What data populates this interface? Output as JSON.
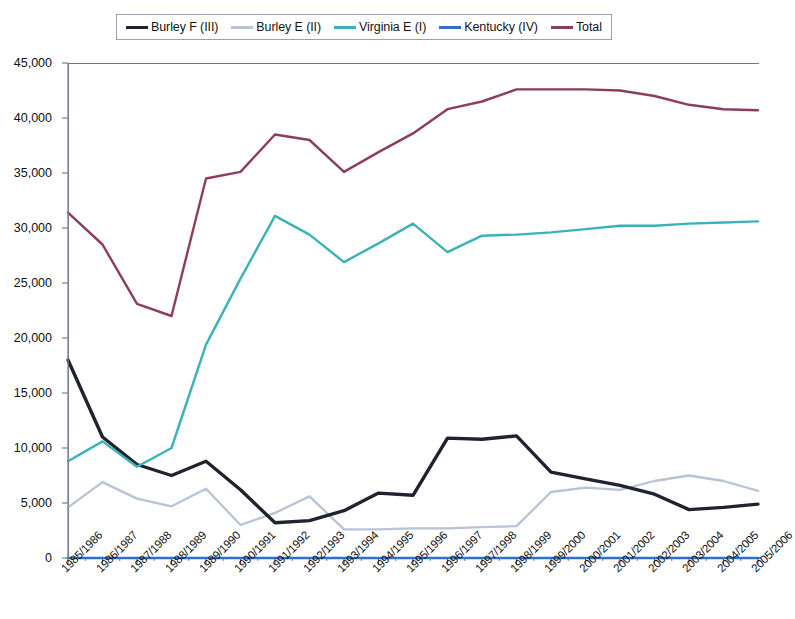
{
  "chart_data": {
    "type": "line",
    "title": "",
    "subtitle": "",
    "xlabel": "",
    "ylabel": "",
    "ylim": [
      0,
      45000
    ],
    "ytick_step": 5000,
    "yticks": [
      "0",
      "5,000",
      "10,000",
      "15,000",
      "20,000",
      "25,000",
      "30,000",
      "35,000",
      "40,000",
      "45,000"
    ],
    "grid": false,
    "legend_position": "top-center",
    "categories": [
      "1985/1986",
      "1986/1987",
      "1987/1988",
      "1988/1989",
      "1989/1990",
      "1990/1991",
      "1991/1992",
      "1992/1993",
      "1993/1994",
      "1994/1995",
      "1995/1996",
      "1996/1997",
      "1997/1998",
      "1998/1999",
      "1999/2000",
      "2000/2001",
      "2001/2002",
      "2002/2003",
      "2003/2004",
      "2004/2005",
      "2005/2006"
    ],
    "series": [
      {
        "name": "Burley F (III)",
        "color": "#1f2330",
        "values": [
          18000,
          11000,
          8500,
          7500,
          8800,
          6200,
          3200,
          3400,
          4300,
          5900,
          5700,
          10900,
          10800,
          11100,
          7800,
          7200,
          6600,
          5800,
          4400,
          4600,
          4900
        ]
      },
      {
        "name": "Burley E (II)",
        "color": "#b7c3d6",
        "values": [
          4600,
          6900,
          5400,
          4700,
          6300,
          3000,
          4100,
          5600,
          2600,
          2600,
          2700,
          2700,
          2800,
          2900,
          6000,
          6400,
          6200,
          7000,
          7500,
          7000,
          6100
        ]
      },
      {
        "name": "Virginia E (I)",
        "color": "#39b3b8",
        "values": [
          8800,
          10600,
          8300,
          10000,
          19400,
          25400,
          31100,
          29400,
          26900,
          28600,
          30400,
          27800,
          29300,
          29400,
          29600,
          29900,
          30200,
          30200,
          30400,
          30500,
          30600
        ]
      },
      {
        "name": "Kentucky (IV)",
        "color": "#2f6fd0",
        "values": [
          0,
          0,
          0,
          0,
          0,
          0,
          0,
          0,
          0,
          0,
          0,
          0,
          0,
          0,
          0,
          0,
          0,
          0,
          0,
          0,
          0
        ]
      },
      {
        "name": "Total",
        "color": "#8e3b62",
        "values": [
          31400,
          28500,
          23100,
          22000,
          34500,
          35100,
          38500,
          38000,
          35100,
          36900,
          38600,
          40800,
          41500,
          42600,
          42600,
          42600,
          42500,
          42000,
          41200,
          40800,
          40700
        ]
      }
    ]
  },
  "legend": {
    "items": [
      {
        "label": "Burley F (III)",
        "color": "#1f2330"
      },
      {
        "label": "Burley E (II)",
        "color": "#b7c3d6"
      },
      {
        "label": "Virginia E (I)",
        "color": "#39b3b8"
      },
      {
        "label": "Kentucky (IV)",
        "color": "#2f6fd0"
      },
      {
        "label": "Total",
        "color": "#8e3b62"
      }
    ]
  },
  "axes": {
    "y_tick_labels": [
      "45,000",
      "40,000",
      "35,000",
      "30,000",
      "25,000",
      "20,000",
      "15,000",
      "10,000",
      "5,000",
      "0"
    ],
    "x_tick_labels": [
      "1985/1986",
      "1986/1987",
      "1987/1988",
      "1988/1989",
      "1989/1990",
      "1990/1991",
      "1991/1992",
      "1992/1993",
      "1993/1994",
      "1994/1995",
      "1995/1996",
      "1996/1997",
      "1997/1998",
      "1998/1999",
      "1999/2000",
      "2000/2001",
      "2001/2002",
      "2002/2003",
      "2003/2004",
      "2004/2005",
      "2005/2006"
    ]
  }
}
